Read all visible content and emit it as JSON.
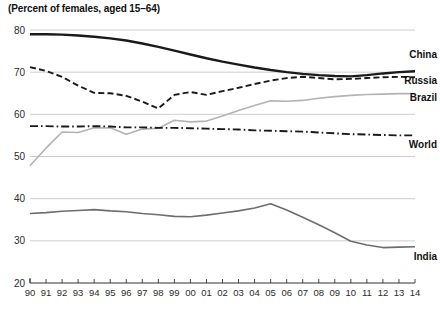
{
  "chart_data": {
    "type": "line",
    "title": "(Percent of females, aged 15–64)",
    "xlabel": "",
    "ylabel": "",
    "ylim": [
      20,
      80
    ],
    "yticks": [
      20,
      30,
      40,
      50,
      60,
      70,
      80
    ],
    "grid": true,
    "legend_position": "right-inline-labels",
    "x": [
      "90",
      "91",
      "92",
      "93",
      "94",
      "95",
      "96",
      "97",
      "98",
      "99",
      "00",
      "01",
      "02",
      "03",
      "04",
      "05",
      "06",
      "07",
      "08",
      "09",
      "10",
      "11",
      "12",
      "13",
      "14"
    ],
    "x_years": [
      1990,
      1991,
      1992,
      1993,
      1994,
      1995,
      1996,
      1997,
      1998,
      1999,
      2000,
      2001,
      2002,
      2003,
      2004,
      2005,
      2006,
      2007,
      2008,
      2009,
      2010,
      2011,
      2012,
      2013,
      2014
    ],
    "series": [
      {
        "name": "China",
        "style": "solid-thick-black",
        "color": "#1a1a1a",
        "values": [
          79.0,
          79.0,
          78.9,
          78.7,
          78.4,
          78.0,
          77.5,
          76.8,
          76.0,
          75.1,
          74.2,
          73.3,
          72.5,
          71.8,
          71.1,
          70.5,
          70.0,
          69.6,
          69.3,
          69.1,
          69.0,
          69.3,
          69.7,
          70.0,
          70.2
        ]
      },
      {
        "name": "Russia",
        "style": "dashed-black",
        "color": "#1a1a1a",
        "values": [
          71.2,
          70.3,
          68.9,
          66.8,
          65.1,
          65.0,
          64.4,
          63.0,
          61.4,
          64.6,
          65.3,
          64.6,
          65.5,
          66.3,
          67.2,
          68.0,
          68.6,
          68.9,
          68.6,
          68.3,
          68.4,
          68.6,
          68.8,
          68.9,
          68.8
        ]
      },
      {
        "name": "Brazil",
        "style": "solid-light-gray",
        "color": "#b3b3b3",
        "values": [
          47.8,
          52.0,
          55.8,
          55.7,
          56.8,
          56.8,
          55.3,
          56.5,
          56.7,
          58.6,
          58.2,
          58.4,
          59.6,
          60.9,
          62.1,
          63.2,
          63.1,
          63.3,
          63.8,
          64.2,
          64.5,
          64.7,
          64.8,
          64.9,
          64.9
        ]
      },
      {
        "name": "World",
        "style": "dash-dot-black",
        "color": "#1a1a1a",
        "values": [
          57.2,
          57.2,
          57.1,
          57.1,
          57.2,
          57.1,
          56.9,
          56.9,
          56.8,
          56.8,
          56.7,
          56.6,
          56.5,
          56.4,
          56.2,
          56.1,
          56.0,
          55.9,
          55.7,
          55.5,
          55.3,
          55.2,
          55.1,
          55.0,
          55.0
        ]
      },
      {
        "name": "India",
        "style": "solid-medium-gray",
        "color": "#6e6e6e",
        "values": [
          36.5,
          36.7,
          37.0,
          37.2,
          37.4,
          37.1,
          36.9,
          36.5,
          36.2,
          35.8,
          35.7,
          36.1,
          36.6,
          37.1,
          37.8,
          38.8,
          37.3,
          35.6,
          33.8,
          31.9,
          29.9,
          29.0,
          28.4,
          28.5,
          28.6
        ]
      }
    ]
  }
}
